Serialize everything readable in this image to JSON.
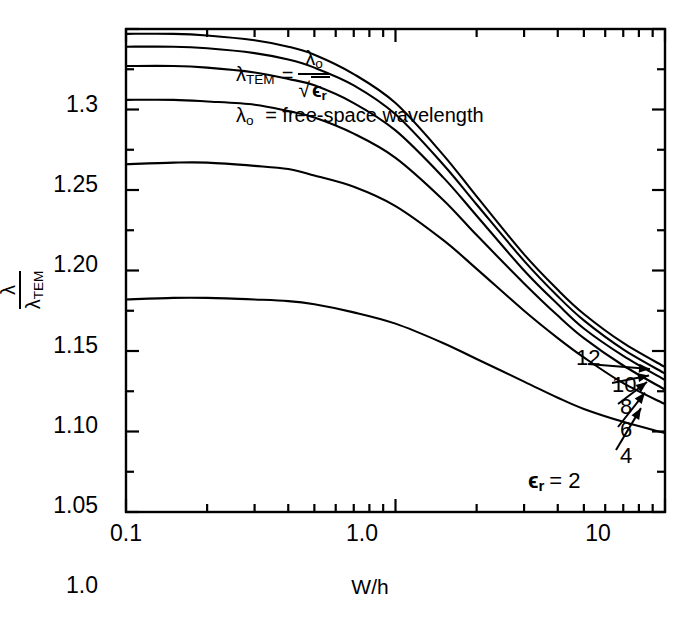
{
  "figure": {
    "background_color": "#ffffff",
    "line_color": "#000000"
  },
  "annotation": {
    "formula_lhs": "λ",
    "formula_lhs_sub": "TEM",
    "formula_eq": "=",
    "formula_num": "λ",
    "formula_num_sub": "o",
    "formula_den_radical": "√",
    "formula_den": "ϵ",
    "formula_den_sub": "r",
    "definition_symbol": "λ",
    "definition_symbol_sub": "o",
    "definition_text": "= free-space wavelength"
  },
  "axes": {
    "y_title_num": "λ",
    "y_title_den": "λ",
    "y_title_den_sub": "TEM",
    "x_title": "W/h"
  },
  "chart_data": {
    "type": "line",
    "title": "",
    "xlabel": "W/h",
    "ylabel": "λ / λ_TEM",
    "xscale": "log",
    "yscale": "linear",
    "xlim": [
      0.1,
      10
    ],
    "ylim": [
      1.0,
      1.3
    ],
    "grid": false,
    "legend_position": "inline-right-end-labels",
    "x_ticks": [
      0.1,
      1.0,
      10
    ],
    "x_tick_labels": [
      "0.1",
      "1.0",
      "10"
    ],
    "x_minor_ticks": [
      0.2,
      0.3,
      0.4,
      0.5,
      0.6,
      0.7,
      0.8,
      0.9,
      2,
      3,
      4,
      5,
      6,
      7,
      8,
      9
    ],
    "y_ticks": [
      1.0,
      1.05,
      1.1,
      1.15,
      1.2,
      1.25,
      1.3
    ],
    "y_tick_labels": [
      "1.0",
      "1.05",
      "1.10",
      "1.15",
      "1.20",
      "1.25",
      "1.3"
    ],
    "y_minor_ticks": [
      1.025,
      1.075,
      1.125,
      1.175,
      1.225,
      1.275
    ],
    "x": [
      0.1,
      0.15,
      0.2,
      0.3,
      0.4,
      0.5,
      0.7,
      1.0,
      1.5,
      2.0,
      3.0,
      4.0,
      5.0,
      7.0,
      10.0
    ],
    "series": [
      {
        "name": "12",
        "label": "12",
        "epsilon_r": 12,
        "values": [
          1.297,
          1.297,
          1.296,
          1.293,
          1.289,
          1.284,
          1.272,
          1.254,
          1.222,
          1.196,
          1.16,
          1.138,
          1.123,
          1.105,
          1.09
        ]
      },
      {
        "name": "10",
        "label": "10",
        "epsilon_r": 10,
        "values": [
          1.289,
          1.289,
          1.288,
          1.285,
          1.281,
          1.276,
          1.265,
          1.247,
          1.216,
          1.191,
          1.156,
          1.134,
          1.119,
          1.101,
          1.086
        ]
      },
      {
        "name": "8",
        "label": "8",
        "epsilon_r": 8,
        "values": [
          1.277,
          1.277,
          1.276,
          1.273,
          1.269,
          1.265,
          1.254,
          1.237,
          1.208,
          1.184,
          1.15,
          1.129,
          1.114,
          1.097,
          1.082
        ]
      },
      {
        "name": "6",
        "label": "6",
        "epsilon_r": 6,
        "values": [
          1.256,
          1.256,
          1.255,
          1.253,
          1.249,
          1.245,
          1.235,
          1.22,
          1.194,
          1.172,
          1.142,
          1.122,
          1.108,
          1.091,
          1.076
        ]
      },
      {
        "name": "4",
        "label": "4",
        "epsilon_r": 4,
        "values": [
          1.216,
          1.217,
          1.217,
          1.215,
          1.213,
          1.209,
          1.202,
          1.19,
          1.169,
          1.151,
          1.125,
          1.108,
          1.096,
          1.08,
          1.067
        ]
      },
      {
        "name": "2",
        "label": "ϵ_r = 2",
        "epsilon_r": 2,
        "values": [
          1.132,
          1.133,
          1.133,
          1.132,
          1.131,
          1.129,
          1.124,
          1.117,
          1.105,
          1.095,
          1.081,
          1.071,
          1.064,
          1.056,
          1.049
        ]
      }
    ],
    "curve_end_labels": [
      "12",
      "10",
      "8",
      "6",
      "4"
    ],
    "curve_end_label_last": "ϵ",
    "curve_end_label_last_sub": "r",
    "curve_end_label_last_rest": "= 2"
  }
}
